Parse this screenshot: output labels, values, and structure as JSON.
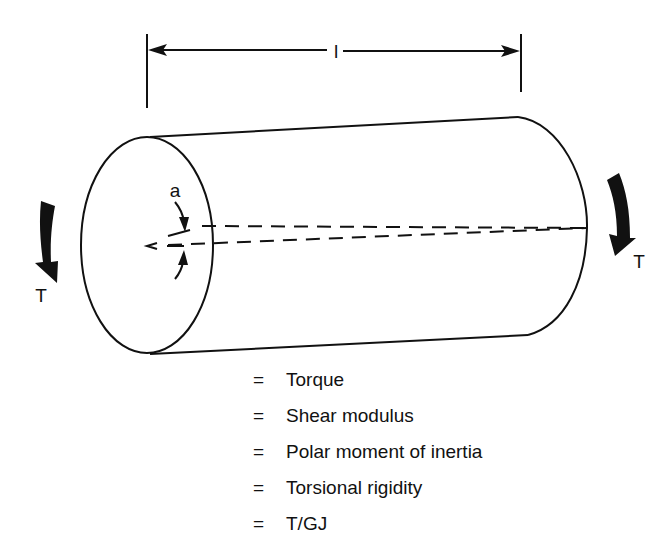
{
  "figure": {
    "type": "torsion-of-cylinder-diagram",
    "length_label": "l",
    "angle_label": "a",
    "torque_label_left": "T",
    "torque_label_right": "T",
    "icons": {
      "dimension_arrow": "double-headed-arrow",
      "torque_arrows": "curved-arrow-down"
    }
  },
  "legend": [
    {
      "symbol": "T",
      "equals": "=",
      "definition": "Torque"
    },
    {
      "symbol": "G",
      "equals": "=",
      "definition": "Shear modulus"
    },
    {
      "symbol": "J",
      "equals": "=",
      "definition": "Polar moment of inertia"
    },
    {
      "symbol": "GJ",
      "equals": "=",
      "definition": "Torsional rigidity"
    },
    {
      "symbol": "a/l",
      "equals": "=",
      "definition": "T/GJ"
    }
  ],
  "colors": {
    "ink": "#111111",
    "background": "#ffffff"
  }
}
